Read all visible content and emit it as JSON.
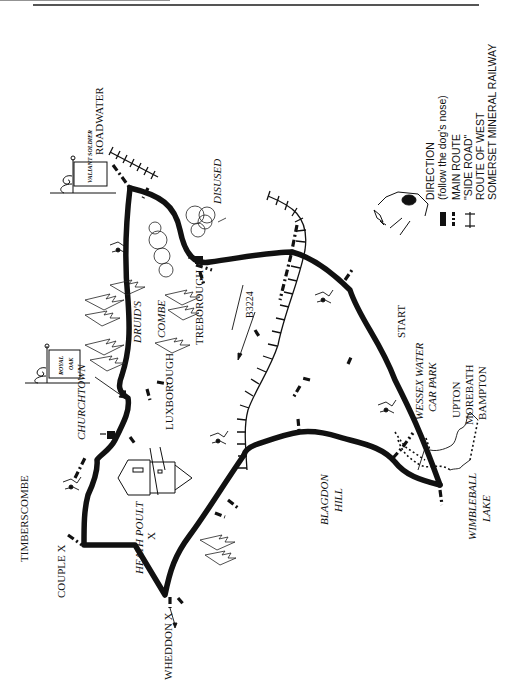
{
  "map": {
    "title_rule": true,
    "orientation": "rotated-90-ccw",
    "places": {
      "roadwater": "ROADWATER",
      "valiant_soldier": "VALIANT SOLDIER",
      "disused_quarry_1": "DISUSED",
      "disused_quarry_2": "QUARRY",
      "royal_oak_1": "ROYAL",
      "royal_oak_2": "OAK",
      "druids": "DRUID'S",
      "combe": "COMBE",
      "treborough": "TREBOROUGH",
      "luxborough": "LUXBOROUGH",
      "churchtown": "CHURCHTOWN",
      "b3224": "B3224",
      "timberscombe": "TIMBERSCOMBE",
      "couple_x": "COUPLE X",
      "heath_poult_1": "HEATH POULT",
      "heath_poult_2": "X",
      "wheddon_x": "WHEDDON X",
      "blagdon_1": "BLAGDON",
      "blagdon_2": "HILL",
      "start": "START",
      "wessex_1": "WESSEX WATER",
      "wessex_2": "CAR PARK",
      "upton": "UPTON",
      "morebath": "MOREBATH",
      "bampton": "BAMPTON",
      "wimbleball_1": "WIMBLEBALL",
      "wimbleball_2": "LAKE"
    },
    "legend": {
      "direction": "DIRECTION",
      "direction_note": "(follow the dog's nose)",
      "main_route": "MAIN ROUTE",
      "side_road": "\"SIDE ROAD\"",
      "route_of_west": "ROUTE OF WEST",
      "railway": "SOMERSET MINERAL RAILWAY"
    },
    "colors": {
      "ink": "#111111",
      "paper": "#ffffff",
      "rule": "#555555"
    }
  }
}
